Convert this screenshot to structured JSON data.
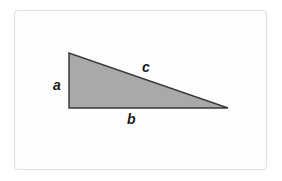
{
  "diagram": {
    "type": "right-triangle",
    "fill_color": "#a9a9a9",
    "stroke_color": "#3a3a3a",
    "vertices": {
      "top": [
        69,
        53
      ],
      "right_angle": [
        69,
        108
      ],
      "right": [
        228,
        108
      ]
    },
    "labels": {
      "a": "a",
      "b": "b",
      "c": "c"
    }
  }
}
